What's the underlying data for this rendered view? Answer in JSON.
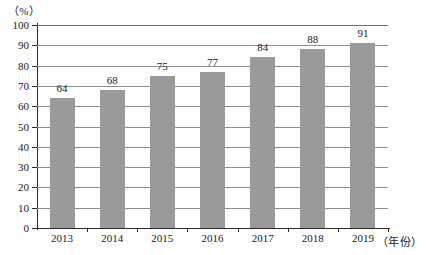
{
  "chart_data": {
    "type": "bar",
    "title": "",
    "subtitle": "",
    "xlabel": "（年份）",
    "ylabel": "（%）",
    "categories": [
      "2013",
      "2014",
      "2015",
      "2016",
      "2017",
      "2018",
      "2019"
    ],
    "values": [
      64,
      68,
      75,
      77,
      84,
      88,
      91
    ],
    "series": [
      {
        "name": "",
        "values": [
          64,
          68,
          75,
          77,
          84,
          88,
          91
        ]
      }
    ],
    "ylim": [
      0,
      100
    ],
    "ytick_labels": [
      "0",
      "10",
      "20",
      "30",
      "40",
      "50",
      "60",
      "70",
      "80",
      "90",
      "100"
    ],
    "ytick_values": [
      0,
      10,
      20,
      30,
      40,
      50,
      60,
      70,
      80,
      90,
      100
    ],
    "grid": "horizontal",
    "legend": "none",
    "data_labels": [
      "64",
      "68",
      "75",
      "77",
      "84",
      "88",
      "91"
    ],
    "bar_color": "#9a9a9a",
    "gridline_color": "#8c8c8c",
    "axis_color": "#2b2b2b",
    "background_color": "#ffffff"
  }
}
